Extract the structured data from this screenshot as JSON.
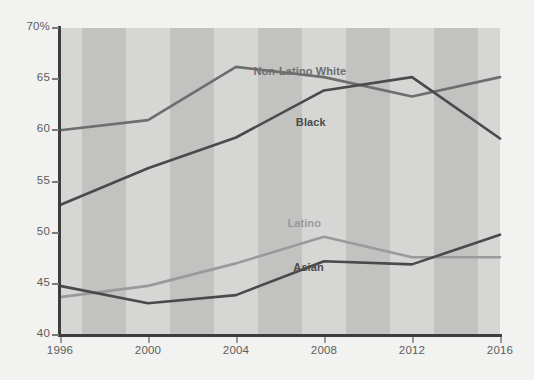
{
  "chart_data": {
    "type": "line",
    "title": "",
    "subtitle": "",
    "xlabel": "",
    "ylabel": "",
    "x": [
      1996,
      2000,
      2004,
      2008,
      2012,
      2016
    ],
    "xtick_labels": [
      "1996",
      "2000",
      "2004",
      "2008",
      "2012",
      "2016"
    ],
    "ytick_labels": [
      "70%",
      "65",
      "60",
      "55",
      "50",
      "45",
      "40"
    ],
    "ytick_values": [
      70,
      65,
      60,
      55,
      50,
      45,
      40
    ],
    "ylim": [
      40,
      70
    ],
    "xlim": [
      1996,
      2016
    ],
    "grid": false,
    "legend": "inline-labels",
    "background_bands": true,
    "series": [
      {
        "name": "Non-Latino White",
        "color": "#6e6e6e",
        "values": [
          60.0,
          61.0,
          66.2,
          65.2,
          63.3,
          65.2
        ],
        "label_x_pct": 54.5,
        "label_y_pct": 14.0
      },
      {
        "name": "Black",
        "color": "#4a4a4a",
        "values": [
          52.7,
          56.3,
          59.3,
          63.9,
          65.2,
          59.2
        ],
        "label_x_pct": 57.0,
        "label_y_pct": 30.5
      },
      {
        "name": "Latino",
        "color": "#9a9a9a",
        "values": [
          43.7,
          44.8,
          47.0,
          49.6,
          47.6,
          47.6
        ],
        "label_x_pct": 55.5,
        "label_y_pct": 63.5
      },
      {
        "name": "Asian",
        "color": "#4a4a4a",
        "values": [
          44.8,
          43.1,
          43.9,
          47.2,
          46.9,
          49.8
        ],
        "label_x_pct": 56.5,
        "label_y_pct": 78.0
      }
    ],
    "band_colors": [
      "#d6d6d4",
      "#c2c2c0"
    ],
    "axis_color": "#3d3d3d",
    "tick_text_color": "#5c5c5c",
    "figure_background": "#f2f2f0"
  }
}
